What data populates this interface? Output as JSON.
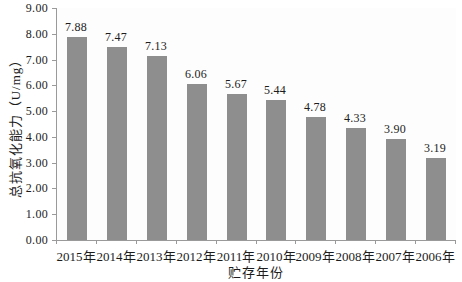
{
  "chart_data": {
    "type": "bar",
    "title": "",
    "xlabel": "贮存年份",
    "ylabel": "总抗氧化能力（U/mg）",
    "categories": [
      "2015年",
      "2014年",
      "2013年",
      "2012年",
      "2011年",
      "2010年",
      "2009年",
      "2008年",
      "2007年",
      "2006年"
    ],
    "values": [
      7.88,
      7.47,
      7.13,
      6.06,
      5.67,
      5.44,
      4.78,
      4.33,
      3.9,
      3.19
    ],
    "value_labels": [
      "7.88",
      "7.47",
      "7.13",
      "6.06",
      "5.67",
      "5.44",
      "4.78",
      "4.33",
      "3.90",
      "3.19"
    ],
    "ylim": [
      0,
      9
    ],
    "ytick_labels": [
      "0.00",
      "1.00",
      "2.00",
      "3.00",
      "4.00",
      "5.00",
      "6.00",
      "7.00",
      "8.00",
      "9.00"
    ],
    "grid": false,
    "legend_position": "none",
    "bar_color": "#8e8e8e",
    "axis_color": "#9a9a9a",
    "text_color": "#1c1c1c"
  }
}
